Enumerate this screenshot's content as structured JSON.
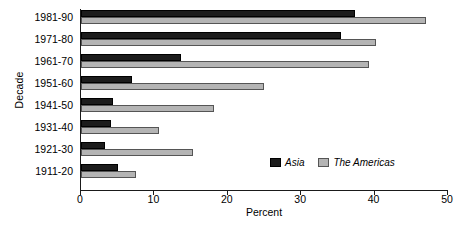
{
  "chart_data": {
    "type": "bar",
    "orientation": "horizontal",
    "title": "",
    "xlabel": "Percent",
    "ylabel": "Decade",
    "xlim": [
      0,
      50
    ],
    "xticks": [
      0,
      10,
      20,
      30,
      40,
      50
    ],
    "xtick_labels": [
      "0",
      "10",
      "20",
      "30",
      "40",
      "50"
    ],
    "grid": false,
    "legend_position": "inside-lower-right",
    "categories": [
      "1981-90",
      "1971-80",
      "1961-70",
      "1951-60",
      "1941-50",
      "1931-40",
      "1921-30",
      "1911-20"
    ],
    "series": [
      {
        "name": "Asia",
        "color": "#1c1c1c",
        "values": [
          37.3,
          35.4,
          13.6,
          6.9,
          4.4,
          4.1,
          3.3,
          5.0
        ]
      },
      {
        "name": "The Americas",
        "color": "#b4b4b4",
        "values": [
          47.0,
          40.2,
          39.2,
          24.9,
          18.1,
          10.6,
          15.2,
          7.5
        ]
      }
    ]
  },
  "legend": {
    "items": [
      {
        "label": "Asia",
        "swatch": "asia"
      },
      {
        "label": "The Americas",
        "swatch": "americas"
      }
    ]
  }
}
